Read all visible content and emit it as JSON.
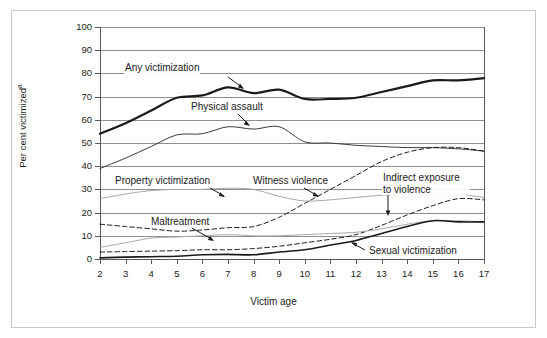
{
  "figure": {
    "top_crop_text": "",
    "axis_title_x": "Victim age",
    "axis_title_y": "Per cent victimized",
    "axis_title_y_superscript": "a"
  },
  "axes": {
    "y_ticks": [
      0,
      10,
      20,
      30,
      40,
      50,
      60,
      70,
      80,
      90,
      100
    ],
    "x_ticks": [
      2,
      3,
      4,
      5,
      6,
      7,
      8,
      9,
      10,
      11,
      12,
      13,
      14,
      15,
      16,
      17
    ],
    "y_min": 0,
    "y_max": 100,
    "x_min": 2,
    "x_max": 17
  },
  "annotations": [
    {
      "name": "any-victimization",
      "label": "Any victimization"
    },
    {
      "name": "physical-assault",
      "label": "Physical assault"
    },
    {
      "name": "property-victimization",
      "label": "Property victimization"
    },
    {
      "name": "witness-violence",
      "label": "Witness violence"
    },
    {
      "name": "indirect-exposure-to-violence",
      "label": "Indirect exposure to violence"
    },
    {
      "name": "maltreatment",
      "label": "Maltreatment"
    },
    {
      "name": "sexual-victimization",
      "label": "Sexual victimization"
    }
  ],
  "colors": {
    "grid": "#8f8f8f",
    "axis": "#595959",
    "dark_line": "#1a1a1a",
    "gray_line": "#a8a8a8",
    "frame": "#c9c9c9",
    "background": "#ffffff"
  },
  "chart_data": {
    "type": "line",
    "title": "",
    "xlabel": "Victim age",
    "ylabel": "Per cent victimized",
    "xlim": [
      2,
      17
    ],
    "ylim": [
      0,
      100
    ],
    "grid": true,
    "legend": "inline annotations with leader arrows",
    "x": [
      2,
      3,
      4,
      5,
      6,
      7,
      8,
      9,
      10,
      11,
      12,
      13,
      14,
      15,
      16,
      17
    ],
    "series": [
      {
        "name": "Any victimization",
        "style": "solid",
        "weight": "thick",
        "color": "#1a1a1a",
        "values": [
          54,
          58.5,
          64,
          69.5,
          70.5,
          74,
          71.5,
          73,
          69,
          69,
          69.5,
          72,
          74.5,
          77,
          77,
          78
        ]
      },
      {
        "name": "Physical assault",
        "style": "solid",
        "weight": "thin",
        "color": "#3a3a3a",
        "values": [
          39,
          43.5,
          48.5,
          53.5,
          54,
          57,
          56,
          57,
          50.5,
          50,
          49,
          48.5,
          48,
          48,
          47.5,
          46.5
        ]
      },
      {
        "name": "Property victimization",
        "style": "solid",
        "weight": "thin",
        "color": "#a8a8a8",
        "values": [
          26,
          28,
          29.5,
          30,
          30,
          30.5,
          30,
          27,
          25,
          25.5,
          26.5,
          27.5,
          28,
          28,
          28,
          26.5
        ]
      },
      {
        "name": "Witness violence",
        "style": "dashed",
        "weight": "thin",
        "color": "#1a1a1a",
        "values": [
          15,
          14,
          13,
          12,
          12.5,
          13.5,
          14,
          18,
          24,
          30,
          36,
          42,
          46,
          48,
          48,
          46.5
        ]
      },
      {
        "name": "Indirect exposure to violence",
        "style": "dashed",
        "weight": "thin",
        "color": "#1a1a1a",
        "values": [
          3,
          3.2,
          3.4,
          3.6,
          4,
          4,
          4.5,
          5.5,
          7,
          8.5,
          10.5,
          14.5,
          19,
          23,
          26,
          25.5
        ]
      },
      {
        "name": "Maltreatment",
        "style": "solid",
        "weight": "thin",
        "color": "#a8a8a8",
        "values": [
          5,
          7,
          9,
          9.5,
          10,
          10.5,
          10,
          10,
          10.5,
          11,
          11.5,
          13,
          15,
          16.5,
          16.5,
          16
        ]
      },
      {
        "name": "Sexual victimization",
        "style": "solid",
        "weight": "medium",
        "color": "#1a1a1a",
        "values": [
          0.5,
          0.8,
          1,
          1.2,
          1.8,
          2,
          1.8,
          3,
          4,
          6,
          8,
          11,
          14,
          16.5,
          16,
          16
        ]
      }
    ]
  }
}
